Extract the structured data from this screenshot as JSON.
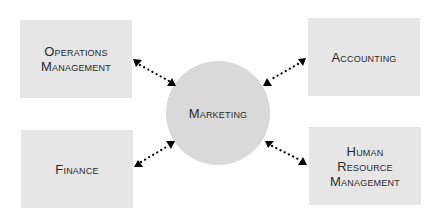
{
  "diagram": {
    "center": {
      "label": "Marketing",
      "color": "#d9d9d9"
    },
    "nodes": [
      {
        "id": "operations-management",
        "label": "Operations\nManagement",
        "position": "top-left"
      },
      {
        "id": "accounting",
        "label": "Accounting",
        "position": "top-right"
      },
      {
        "id": "finance",
        "label": "Finance",
        "position": "bottom-left"
      },
      {
        "id": "human-resource-management",
        "label": "Human\nResource\nManagement",
        "position": "bottom-right"
      }
    ],
    "box_color": "#e6e6e6",
    "connector_style": "dotted-double-arrow",
    "connector_color": "#000000"
  }
}
